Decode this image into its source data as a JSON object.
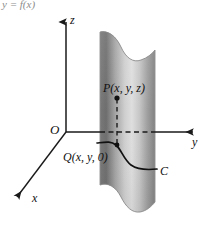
{
  "figure": {
    "header_fragment": "y = f(x)",
    "axes": {
      "z_label": "z",
      "y_label": "y",
      "x_label": "x",
      "origin_label": "O"
    },
    "points": {
      "upper_label": "P(x, y, z)",
      "lower_label": "Q(x, y, 0)"
    },
    "curve": {
      "label": "C"
    },
    "colors": {
      "axis": "#1a1a1a",
      "surface_dark": "#6f6f6f",
      "surface_mid": "#c8c8c8",
      "surface_light": "#e2e2e2",
      "surface_edge": "#8a8a8a",
      "curve": "#111111",
      "background": "#ffffff",
      "header_text": "#8d8d8d"
    }
  }
}
